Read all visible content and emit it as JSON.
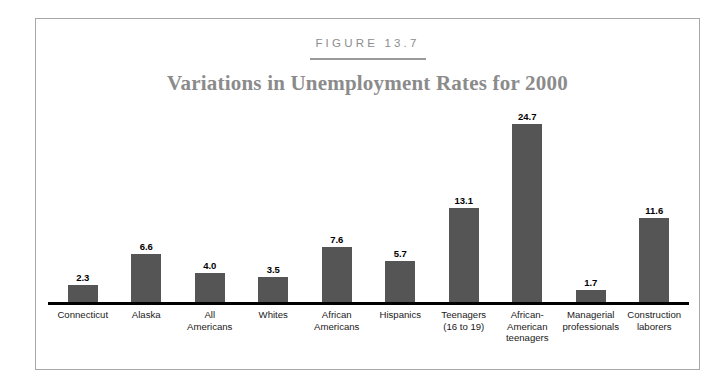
{
  "figure": {
    "label": "FIGURE 13.7",
    "title": "Variations in Unemployment Rates for 2000"
  },
  "colors": {
    "bar": "#555555",
    "title": "#8b8b8b",
    "label": "#8d8d8d",
    "axis": "#000000",
    "frame": "#a8a8a8",
    "background": "#ffffff"
  },
  "chart_data": {
    "type": "bar",
    "title": "Variations in Unemployment Rates for 2000",
    "xlabel": "",
    "ylabel": "",
    "ylim": [
      0,
      26
    ],
    "grid": false,
    "legend": null,
    "value_labels": true,
    "categories": [
      "Connecticut",
      "Alaska",
      "All\nAmericans",
      "Whites",
      "African\nAmericans",
      "Hispanics",
      "Teenagers\n(16 to 19)",
      "African-\nAmerican\nteenagers",
      "Managerial\nprofessionals",
      "Construction\nlaborers"
    ],
    "values": [
      2.3,
      6.6,
      4.0,
      3.5,
      7.6,
      5.7,
      13.1,
      24.7,
      1.7,
      11.6
    ],
    "value_text": [
      "2.3",
      "6.6",
      "4.0",
      "3.5",
      "7.6",
      "5.7",
      "13.1",
      "24.7",
      "1.7",
      "11.6"
    ]
  }
}
